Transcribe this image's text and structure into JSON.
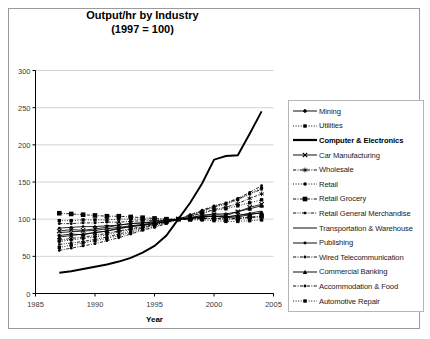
{
  "chart_data": {
    "type": "line",
    "title": "Output/hr by Industry",
    "subtitle": "(1997 = 100)",
    "xlabel": "Year",
    "ylabel": "",
    "xlim": [
      1985,
      2005
    ],
    "ylim": [
      0,
      300
    ],
    "xticks": [
      1985,
      1990,
      1995,
      2000,
      2005
    ],
    "yticks": [
      0,
      50,
      100,
      150,
      200,
      250,
      300
    ],
    "grid": "horizontal",
    "legend_position": "right",
    "x": [
      1987,
      1988,
      1989,
      1990,
      1991,
      1992,
      1993,
      1994,
      1995,
      1996,
      1997,
      1998,
      1999,
      2000,
      2001,
      2002,
      2003,
      2004
    ],
    "series": [
      {
        "name": "Mining",
        "marker": "diamond",
        "dash": "solid",
        "values": [
          78,
          80,
          79,
          82,
          84,
          88,
          90,
          92,
          94,
          97,
          100,
          101,
          103,
          104,
          103,
          105,
          107,
          108
        ]
      },
      {
        "name": "Utilities",
        "marker": "square",
        "dash": "dotted",
        "values": [
          62,
          65,
          68,
          71,
          74,
          78,
          82,
          86,
          90,
          95,
          100,
          104,
          108,
          112,
          114,
          118,
          122,
          126
        ]
      },
      {
        "name": "Computer & Electronics",
        "marker": "none",
        "dash": "solid-bold",
        "values": [
          28,
          30,
          33,
          36,
          39,
          43,
          48,
          55,
          64,
          78,
          100,
          122,
          148,
          180,
          185,
          186,
          215,
          245
        ]
      },
      {
        "name": "Car Manufacturing",
        "marker": "x",
        "dash": "solid",
        "values": [
          84,
          86,
          85,
          87,
          89,
          92,
          94,
          95,
          97,
          99,
          100,
          102,
          105,
          106,
          105,
          110,
          116,
          120
        ]
      },
      {
        "name": "Wholesale",
        "marker": "star",
        "dash": "dashdot",
        "values": [
          72,
          74,
          76,
          78,
          81,
          84,
          87,
          90,
          93,
          96,
          100,
          104,
          108,
          113,
          116,
          121,
          128,
          134
        ]
      },
      {
        "name": "Retail",
        "marker": "circle",
        "dash": "dotted",
        "values": [
          70,
          72,
          74,
          76,
          79,
          83,
          86,
          89,
          92,
          96,
          100,
          105,
          110,
          116,
          120,
          126,
          134,
          142
        ]
      },
      {
        "name": "Retail Grocery",
        "marker": "square-bold",
        "dash": "dashdot",
        "values": [
          108,
          107,
          106,
          105,
          104,
          104,
          103,
          102,
          101,
          100,
          100,
          100,
          101,
          101,
          100,
          101,
          103,
          104
        ]
      },
      {
        "name": "Retail General Merchandise",
        "marker": "small-square",
        "dash": "dashdotdot",
        "values": [
          66,
          68,
          70,
          73,
          76,
          80,
          84,
          88,
          92,
          96,
          100,
          105,
          111,
          117,
          121,
          127,
          134,
          140
        ]
      },
      {
        "name": "Transportation & Warehouse",
        "marker": "none",
        "dash": "solid",
        "values": [
          82,
          83,
          84,
          85,
          87,
          89,
          91,
          93,
          95,
          97,
          100,
          101,
          103,
          104,
          103,
          105,
          108,
          111
        ]
      },
      {
        "name": "Publishing",
        "marker": "dot",
        "dash": "solid",
        "values": [
          88,
          89,
          90,
          90,
          91,
          92,
          94,
          95,
          96,
          98,
          100,
          101,
          103,
          104,
          102,
          103,
          106,
          109
        ]
      },
      {
        "name": "Wired Telecommunication",
        "marker": "dot",
        "dash": "dashdot",
        "values": [
          58,
          61,
          64,
          67,
          71,
          75,
          80,
          85,
          89,
          94,
          100,
          106,
          112,
          118,
          122,
          128,
          136,
          145
        ]
      },
      {
        "name": "Commercial Banking",
        "marker": "triangle",
        "dash": "solid",
        "values": [
          76,
          78,
          80,
          82,
          84,
          87,
          90,
          92,
          94,
          97,
          100,
          102,
          105,
          107,
          107,
          110,
          114,
          118
        ]
      },
      {
        "name": "Accommodation & Food",
        "marker": "dot",
        "dash": "dashdot",
        "values": [
          94,
          94,
          95,
          95,
          96,
          96,
          97,
          98,
          98,
          99,
          100,
          100,
          101,
          101,
          100,
          101,
          102,
          103
        ]
      },
      {
        "name": "Automotive Repair",
        "marker": "square",
        "dash": "dotted",
        "values": [
          98,
          98,
          99,
          99,
          99,
          100,
          100,
          100,
          100,
          100,
          100,
          99,
          99,
          98,
          97,
          97,
          98,
          99
        ]
      }
    ]
  }
}
